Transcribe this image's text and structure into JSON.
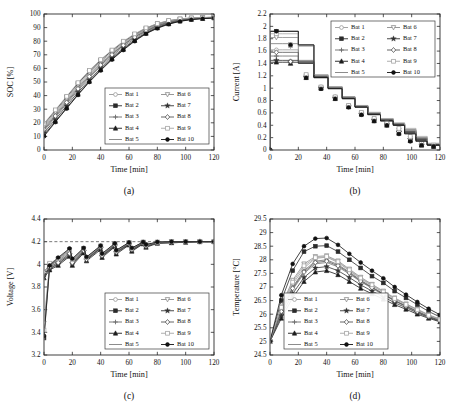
{
  "figure": {
    "panel_labels": [
      "(a)",
      "(b)",
      "(c)",
      "(d)"
    ],
    "series_names": [
      "Bat 1",
      "Bat 2",
      "Bat 3",
      "Bat 4",
      "Bat 5",
      "Bat 6",
      "Bat 7",
      "Bat 8",
      "Bat 9",
      "Bat 10"
    ],
    "series_markers": [
      "circle-open",
      "square-filled",
      "plus",
      "triangle-up-filled",
      "none",
      "triangle-down-open",
      "star-filled",
      "diamond-open",
      "square-open",
      "circle-filled"
    ],
    "series_colors": [
      "#9a9a9a",
      "#2b2b2b",
      "#6b6b6b",
      "#1c1c1c",
      "#7f7f7f",
      "#8c8c8c",
      "#333333",
      "#555555",
      "#a5a5a5",
      "#111111"
    ],
    "legend_columns": 2
  },
  "chart_data": [
    {
      "type": "line",
      "panel": "(a)",
      "title": "",
      "xlabel": "Time [min]",
      "ylabel": "SOC [%]",
      "xlim": [
        0,
        120
      ],
      "ylim": [
        0,
        100
      ],
      "xticks": [
        0,
        20,
        40,
        60,
        80,
        100,
        120
      ],
      "yticks": [
        0,
        10,
        20,
        30,
        40,
        50,
        60,
        70,
        80,
        90,
        100
      ],
      "grid": false,
      "legend_position": "lower-right",
      "x": [
        0,
        8,
        16,
        24,
        32,
        40,
        48,
        56,
        64,
        72,
        80,
        88,
        96,
        104,
        112,
        120
      ],
      "series": [
        {
          "name": "Bat 1",
          "values": [
            17,
            27,
            37,
            47,
            56,
            64,
            71,
            78,
            84,
            88.5,
            92,
            94.5,
            96,
            96.8,
            97.2,
            97.5
          ]
        },
        {
          "name": "Bat 2",
          "values": [
            19,
            29,
            39,
            49,
            58,
            66,
            73,
            79.5,
            85,
            89.5,
            92.8,
            95,
            96.3,
            97,
            97.4,
            97.6
          ]
        },
        {
          "name": "Bat 3",
          "values": [
            14,
            24,
            34,
            44,
            53,
            61.5,
            69,
            76,
            82,
            87,
            90.8,
            93.5,
            95.3,
            96.4,
            97,
            97.4
          ]
        },
        {
          "name": "Bat 4",
          "values": [
            11,
            21,
            31,
            41,
            50.5,
            59,
            67,
            74,
            80.5,
            85.8,
            89.8,
            92.8,
            94.8,
            96,
            96.7,
            97.2
          ]
        },
        {
          "name": "Bat 5",
          "values": [
            16,
            26,
            36,
            46,
            55,
            63.5,
            70.5,
            77.5,
            83.5,
            88,
            91.6,
            94.2,
            95.8,
            96.7,
            97.1,
            97.4
          ]
        },
        {
          "name": "Bat 6",
          "values": [
            18,
            28,
            38,
            48,
            57,
            65,
            72,
            78.8,
            84.5,
            89,
            92.4,
            94.8,
            96.1,
            96.9,
            97.3,
            97.5
          ]
        },
        {
          "name": "Bat 7",
          "values": [
            12.5,
            22.5,
            32.5,
            42.5,
            51.5,
            60,
            67.8,
            74.8,
            81,
            86.2,
            90.2,
            93,
            95,
            96.2,
            96.8,
            97.3
          ]
        },
        {
          "name": "Bat 8",
          "values": [
            15,
            25,
            35,
            45,
            54,
            62.5,
            70,
            77,
            83,
            87.5,
            91.2,
            93.8,
            95.5,
            96.5,
            97,
            97.4
          ]
        },
        {
          "name": "Bat 9",
          "values": [
            19.5,
            29.5,
            39.5,
            49.5,
            58.5,
            66.5,
            73.5,
            80,
            85.4,
            89.8,
            93,
            95.2,
            96.4,
            97.1,
            97.4,
            97.6
          ]
        },
        {
          "name": "Bat 10",
          "values": [
            10,
            20.5,
            30.5,
            40.5,
            50,
            58.5,
            66.5,
            73.5,
            80,
            85.5,
            89.5,
            92.5,
            94.6,
            95.9,
            96.6,
            97.1
          ]
        }
      ]
    },
    {
      "type": "line",
      "panel": "(b)",
      "title": "",
      "xlabel": "Time [min]",
      "ylabel": "Current [A]",
      "xlim": [
        0,
        120
      ],
      "ylim": [
        0,
        2.2
      ],
      "xticks": [
        0,
        20,
        40,
        60,
        80,
        100,
        120
      ],
      "yticks": [
        0,
        0.2,
        0.4,
        0.6,
        0.8,
        1,
        1.2,
        1.4,
        1.6,
        1.8,
        2,
        2.2
      ],
      "grid": false,
      "legend_position": "upper-right",
      "note": "stepped (staircase) constant-current charging profile, current decreases in steps",
      "steps_x": [
        0,
        9,
        20,
        31,
        41,
        51,
        60,
        69,
        78,
        87,
        95,
        103,
        111,
        120
      ],
      "series": [
        {
          "name": "Bat 1",
          "values": [
            1.62,
            1.62,
            1.44,
            1.2,
            1.02,
            0.86,
            0.72,
            0.6,
            0.5,
            0.42,
            0.3,
            0.18,
            0.09,
            0.07
          ]
        },
        {
          "name": "Bat 2",
          "values": [
            1.92,
            1.92,
            1.7,
            1.18,
            1.0,
            0.84,
            0.7,
            0.58,
            0.48,
            0.41,
            0.28,
            0.16,
            0.08,
            0.06
          ]
        },
        {
          "name": "Bat 3",
          "values": [
            1.52,
            1.52,
            1.41,
            1.19,
            1.01,
            0.85,
            0.71,
            0.59,
            0.49,
            0.42,
            0.31,
            0.19,
            0.09,
            0.07
          ]
        },
        {
          "name": "Bat 4",
          "values": [
            1.42,
            1.42,
            1.4,
            1.17,
            1.0,
            0.83,
            0.7,
            0.58,
            0.47,
            0.4,
            0.27,
            0.15,
            0.08,
            0.06
          ]
        },
        {
          "name": "Bat 5",
          "values": [
            1.72,
            1.72,
            1.45,
            1.21,
            1.02,
            0.86,
            0.72,
            0.6,
            0.5,
            0.43,
            0.33,
            0.2,
            0.1,
            0.07
          ]
        },
        {
          "name": "Bat 6",
          "values": [
            1.82,
            1.82,
            1.68,
            1.2,
            1.01,
            0.85,
            0.71,
            0.59,
            0.49,
            0.42,
            0.32,
            0.19,
            0.09,
            0.07
          ]
        },
        {
          "name": "Bat 7",
          "values": [
            1.45,
            1.45,
            1.42,
            1.18,
            1.0,
            0.84,
            0.7,
            0.58,
            0.48,
            0.41,
            0.29,
            0.17,
            0.08,
            0.06
          ]
        },
        {
          "name": "Bat 8",
          "values": [
            1.58,
            1.58,
            1.43,
            1.19,
            1.01,
            0.85,
            0.71,
            0.59,
            0.49,
            0.42,
            0.3,
            0.18,
            0.09,
            0.07
          ]
        },
        {
          "name": "Bat 9",
          "values": [
            1.88,
            1.88,
            1.69,
            1.22,
            1.02,
            0.86,
            0.72,
            0.61,
            0.51,
            0.44,
            0.35,
            0.22,
            0.11,
            0.08
          ]
        },
        {
          "name": "Bat 10",
          "values": [
            1.92,
            1.92,
            1.7,
            1.17,
            0.99,
            0.83,
            0.69,
            0.57,
            0.47,
            0.4,
            0.26,
            0.14,
            0.08,
            0.06
          ]
        }
      ]
    },
    {
      "type": "line",
      "panel": "(c)",
      "title": "",
      "xlabel": "Time [min]",
      "ylabel": "Voltage [V]",
      "xlim": [
        0,
        120
      ],
      "ylim": [
        3.2,
        4.4
      ],
      "xticks": [
        0,
        20,
        40,
        60,
        80,
        100,
        120
      ],
      "yticks": [
        3.2,
        3.4,
        3.6,
        3.8,
        4.0,
        4.2,
        4.4
      ],
      "grid": false,
      "legend_position": "lower-right",
      "limit_line": {
        "y": 4.2,
        "style": "dashed",
        "label": "4.2 V cut-off"
      },
      "note": "sawtooth voltage: rises during each CC step then drops at step change, asymptotes to 4.2 V",
      "x": [
        0,
        4,
        10,
        18,
        20,
        28,
        30,
        40,
        41,
        50,
        51,
        60,
        62,
        70,
        72,
        80,
        90,
        100,
        110,
        120
      ],
      "series": [
        {
          "name": "Bat 1",
          "values": [
            3.9,
            3.98,
            4.02,
            4.1,
            4.02,
            4.12,
            4.05,
            4.15,
            4.08,
            4.17,
            4.11,
            4.18,
            4.13,
            4.19,
            4.16,
            4.19,
            4.195,
            4.2,
            4.2,
            4.2
          ]
        },
        {
          "name": "Bat 2",
          "values": [
            3.35,
            3.98,
            4.05,
            4.13,
            4.04,
            4.14,
            4.06,
            4.16,
            4.09,
            4.18,
            4.12,
            4.19,
            4.14,
            4.195,
            4.17,
            4.195,
            4.2,
            4.2,
            4.2,
            4.2
          ]
        },
        {
          "name": "Bat 3",
          "values": [
            3.92,
            3.96,
            4.0,
            4.08,
            4.0,
            4.11,
            4.04,
            4.14,
            4.07,
            4.16,
            4.1,
            4.175,
            4.12,
            4.185,
            4.155,
            4.19,
            4.19,
            4.195,
            4.2,
            4.2
          ]
        },
        {
          "name": "Bat 4",
          "values": [
            3.88,
            3.95,
            3.99,
            4.07,
            3.99,
            4.1,
            4.03,
            4.13,
            4.06,
            4.155,
            4.09,
            4.17,
            4.115,
            4.18,
            4.15,
            4.185,
            4.19,
            4.195,
            4.2,
            4.2
          ]
        },
        {
          "name": "Bat 5",
          "values": [
            3.94,
            3.99,
            4.03,
            4.11,
            4.03,
            4.13,
            4.05,
            4.155,
            4.085,
            4.175,
            4.115,
            4.185,
            4.135,
            4.19,
            4.165,
            4.19,
            4.195,
            4.2,
            4.2,
            4.2
          ]
        },
        {
          "name": "Bat 6",
          "values": [
            3.48,
            4.0,
            4.04,
            4.12,
            4.035,
            4.135,
            4.055,
            4.16,
            4.09,
            4.18,
            4.12,
            4.19,
            4.14,
            4.195,
            4.17,
            4.195,
            4.2,
            4.2,
            4.2,
            4.2
          ]
        },
        {
          "name": "Bat 7",
          "values": [
            3.91,
            3.965,
            4.005,
            4.085,
            4.005,
            4.115,
            4.04,
            4.145,
            4.072,
            4.165,
            4.105,
            4.178,
            4.125,
            4.187,
            4.158,
            4.19,
            4.192,
            4.197,
            4.2,
            4.2
          ]
        },
        {
          "name": "Bat 8",
          "values": [
            3.93,
            3.975,
            4.015,
            4.095,
            4.015,
            4.122,
            4.045,
            4.15,
            4.078,
            4.17,
            4.108,
            4.182,
            4.13,
            4.19,
            4.162,
            4.19,
            4.195,
            4.198,
            4.2,
            4.2
          ]
        },
        {
          "name": "Bat 9",
          "values": [
            3.42,
            4.01,
            4.05,
            4.13,
            4.04,
            4.14,
            4.06,
            4.162,
            4.092,
            4.182,
            4.122,
            4.192,
            4.142,
            4.196,
            4.172,
            4.196,
            4.2,
            4.2,
            4.2,
            4.2
          ]
        },
        {
          "name": "Bat 10",
          "values": [
            3.37,
            3.99,
            4.06,
            4.14,
            4.05,
            4.145,
            4.065,
            4.165,
            4.095,
            4.185,
            4.125,
            4.193,
            4.145,
            4.197,
            4.175,
            4.197,
            4.2,
            4.2,
            4.2,
            4.2
          ]
        }
      ]
    },
    {
      "type": "line",
      "panel": "(d)",
      "title": "",
      "xlabel": "Time [min]",
      "ylabel": "Temperature [°C]",
      "xlim": [
        0,
        120
      ],
      "ylim": [
        24.5,
        29.5
      ],
      "xticks": [
        0,
        20,
        40,
        60,
        80,
        100,
        120
      ],
      "yticks": [
        24.5,
        25,
        25.5,
        26,
        26.5,
        27,
        27.5,
        28,
        28.5,
        29,
        29.5
      ],
      "grid": false,
      "legend_position": "lower-left",
      "note": "temperature rises to a peak near t = 35-42 min then decays",
      "x": [
        0,
        8,
        16,
        24,
        32,
        40,
        48,
        56,
        64,
        72,
        80,
        88,
        96,
        104,
        112,
        120
      ],
      "series": [
        {
          "name": "Bat 1",
          "values": [
            25.0,
            26.2,
            27.1,
            27.7,
            28.05,
            28.1,
            27.9,
            27.6,
            27.3,
            27.05,
            26.8,
            26.55,
            26.35,
            26.15,
            25.95,
            25.8
          ]
        },
        {
          "name": "Bat 2",
          "values": [
            25.0,
            26.5,
            27.6,
            28.3,
            28.5,
            28.52,
            28.3,
            28.0,
            27.7,
            27.4,
            27.15,
            26.85,
            26.6,
            26.35,
            26.1,
            25.9
          ]
        },
        {
          "name": "Bat 3",
          "values": [
            25.0,
            26.15,
            27.0,
            27.6,
            27.95,
            28.0,
            27.82,
            27.55,
            27.25,
            27.0,
            26.75,
            26.5,
            26.3,
            26.1,
            25.9,
            25.78
          ]
        },
        {
          "name": "Bat 4",
          "values": [
            25.0,
            25.85,
            26.6,
            27.2,
            27.55,
            27.6,
            27.45,
            27.2,
            26.95,
            26.75,
            26.55,
            26.35,
            26.18,
            26.0,
            25.85,
            25.72
          ]
        },
        {
          "name": "Bat 5",
          "values": [
            25.0,
            26.05,
            26.9,
            27.5,
            27.85,
            27.9,
            27.74,
            27.48,
            27.2,
            26.95,
            26.72,
            26.48,
            26.28,
            26.08,
            25.9,
            25.76
          ]
        },
        {
          "name": "Bat 6",
          "values": [
            25.0,
            26.3,
            27.25,
            27.85,
            28.12,
            28.15,
            27.96,
            27.66,
            27.36,
            27.1,
            26.85,
            26.6,
            26.38,
            26.18,
            25.98,
            25.82
          ]
        },
        {
          "name": "Bat 7",
          "values": [
            25.0,
            25.95,
            26.75,
            27.35,
            27.7,
            27.75,
            27.6,
            27.35,
            27.08,
            26.85,
            26.64,
            26.42,
            26.24,
            26.05,
            25.88,
            25.74
          ]
        },
        {
          "name": "Bat 8",
          "values": [
            25.0,
            26.1,
            26.95,
            27.55,
            27.9,
            27.95,
            27.78,
            27.52,
            27.22,
            26.98,
            26.74,
            26.5,
            26.3,
            26.1,
            25.92,
            25.77
          ]
        },
        {
          "name": "Bat 9",
          "values": [
            25.0,
            26.25,
            27.18,
            27.78,
            28.08,
            28.12,
            27.93,
            27.63,
            27.33,
            27.08,
            26.82,
            26.58,
            26.36,
            26.16,
            25.96,
            25.8
          ]
        },
        {
          "name": "Bat 10",
          "values": [
            25.0,
            26.7,
            27.85,
            28.5,
            28.78,
            28.8,
            28.55,
            28.22,
            27.9,
            27.6,
            27.32,
            27.0,
            26.72,
            26.45,
            26.2,
            25.98
          ]
        }
      ]
    }
  ]
}
